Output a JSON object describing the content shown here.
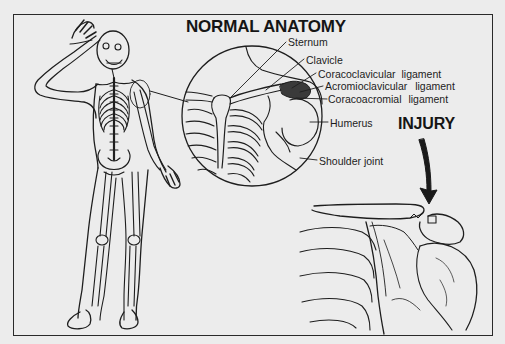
{
  "figure": {
    "titles": {
      "normal_anatomy": "NORMAL ANATOMY",
      "injury": "INJURY"
    },
    "labels": {
      "sternum": "Sternum",
      "clavicle": "Clavicle",
      "coracoclavicular_ligament": "Coracoclavicular ligament",
      "acromioclavicular_ligament": "Acromioclavicular ligament",
      "coracoacromial_ligament": "Coracoacromial ligament",
      "humerus": "Humerus",
      "shoulder_joint": "Shoulder joint"
    },
    "panels": [
      {
        "name": "full-skeleton",
        "description": "Front view of full human skeleton with body outline, right arm raised to head"
      },
      {
        "name": "magnified-shoulder-circle",
        "description": "Circular magnified view of normal shoulder anatomy"
      },
      {
        "name": "injury-shoulder",
        "description": "Shoulder with separated acromioclavicular joint, arrow pointing to injury"
      }
    ],
    "colors": {
      "background": "#ececec",
      "ink": "#1a1a1a"
    }
  }
}
